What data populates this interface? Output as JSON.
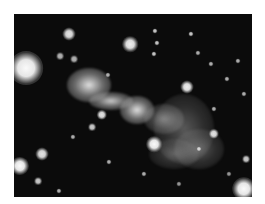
{
  "image": {
    "subject": "astronomical photograph of a jet-like nebula with surrounding stars",
    "colors": {
      "background": "#ffffff",
      "sky": "#0b0b0b",
      "nebula": "#e8e8e8",
      "halo": "#8a8a8a"
    },
    "frame": {
      "left": 14,
      "top": 14,
      "width": 238,
      "height": 183
    },
    "nebula_lobes": [
      {
        "x": 75,
        "y": 71,
        "w": 44,
        "h": 34,
        "o": 0.95
      },
      {
        "x": 97,
        "y": 87,
        "w": 44,
        "h": 18,
        "o": 0.85
      },
      {
        "x": 123,
        "y": 96,
        "w": 34,
        "h": 28,
        "o": 0.95
      },
      {
        "x": 150,
        "y": 105,
        "w": 40,
        "h": 30,
        "o": 0.5
      },
      {
        "x": 170,
        "y": 115,
        "w": 60,
        "h": 70,
        "o": 0.35
      },
      {
        "x": 185,
        "y": 135,
        "w": 50,
        "h": 40,
        "o": 0.35
      },
      {
        "x": 160,
        "y": 140,
        "w": 50,
        "h": 30,
        "o": 0.3
      }
    ],
    "stars": [
      {
        "x": 12,
        "y": 54,
        "r": 13,
        "o": 1
      },
      {
        "x": 55,
        "y": 20,
        "r": 5,
        "o": 0.9
      },
      {
        "x": 116,
        "y": 30,
        "r": 6,
        "o": 0.95
      },
      {
        "x": 46,
        "y": 42,
        "r": 3,
        "o": 0.7
      },
      {
        "x": 60,
        "y": 45,
        "r": 3,
        "o": 0.7
      },
      {
        "x": 141,
        "y": 17,
        "r": 2,
        "o": 0.8
      },
      {
        "x": 177,
        "y": 20,
        "r": 2,
        "o": 0.8
      },
      {
        "x": 143,
        "y": 29,
        "r": 2,
        "o": 0.8
      },
      {
        "x": 140,
        "y": 40,
        "r": 2,
        "o": 0.8
      },
      {
        "x": 184,
        "y": 39,
        "r": 2,
        "o": 0.7
      },
      {
        "x": 197,
        "y": 50,
        "r": 2,
        "o": 0.7
      },
      {
        "x": 224,
        "y": 47,
        "r": 2,
        "o": 0.7
      },
      {
        "x": 173,
        "y": 73,
        "r": 5,
        "o": 0.95
      },
      {
        "x": 94,
        "y": 61,
        "r": 2,
        "o": 0.7
      },
      {
        "x": 213,
        "y": 65,
        "r": 2,
        "o": 0.7
      },
      {
        "x": 230,
        "y": 80,
        "r": 2,
        "o": 0.7
      },
      {
        "x": 200,
        "y": 95,
        "r": 2,
        "o": 0.7
      },
      {
        "x": 88,
        "y": 101,
        "r": 4,
        "o": 0.9
      },
      {
        "x": 78,
        "y": 113,
        "r": 3,
        "o": 0.8
      },
      {
        "x": 59,
        "y": 123,
        "r": 2,
        "o": 0.7
      },
      {
        "x": 140,
        "y": 130,
        "r": 6,
        "o": 1
      },
      {
        "x": 200,
        "y": 120,
        "r": 4,
        "o": 0.9
      },
      {
        "x": 185,
        "y": 135,
        "r": 2,
        "o": 0.8
      },
      {
        "x": 28,
        "y": 140,
        "r": 5,
        "o": 0.9
      },
      {
        "x": 6,
        "y": 152,
        "r": 7,
        "o": 1
      },
      {
        "x": 24,
        "y": 167,
        "r": 3,
        "o": 0.8
      },
      {
        "x": 95,
        "y": 148,
        "r": 2,
        "o": 0.7
      },
      {
        "x": 130,
        "y": 160,
        "r": 2,
        "o": 0.7
      },
      {
        "x": 232,
        "y": 145,
        "r": 3,
        "o": 0.8
      },
      {
        "x": 230,
        "y": 175,
        "r": 9,
        "o": 1
      },
      {
        "x": 45,
        "y": 177,
        "r": 2,
        "o": 0.7
      },
      {
        "x": 165,
        "y": 170,
        "r": 2,
        "o": 0.6
      },
      {
        "x": 215,
        "y": 160,
        "r": 2,
        "o": 0.6
      }
    ]
  }
}
